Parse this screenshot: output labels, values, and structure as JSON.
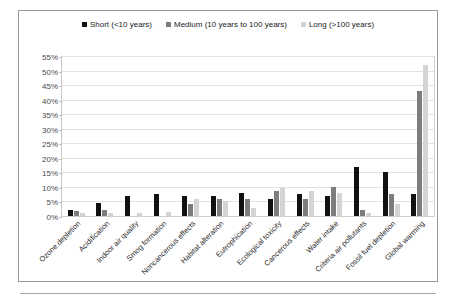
{
  "chart_data": {
    "type": "bar",
    "title": "",
    "xlabel": "",
    "ylabel": "",
    "ylim": [
      0,
      55
    ],
    "ytick_labels": [
      "55%",
      "50%",
      "45%",
      "40%",
      "35%",
      "30%",
      "25%",
      "20%",
      "15%",
      "10%",
      "5%",
      "0%"
    ],
    "ytick_values": [
      55,
      50,
      45,
      40,
      35,
      30,
      25,
      20,
      15,
      10,
      5,
      0
    ],
    "grid": true,
    "legend_position": "top-center",
    "categories": [
      "Ozone depletion",
      "Acidification",
      "Indoor air quality",
      "Smog formation",
      "Noncancerous effects",
      "Habitat alteration",
      "Eutrophication",
      "Ecological toxicity",
      "Cancerous effects",
      "Water intake",
      "Criteria air pollutants",
      "Fossil fuel depletion",
      "Global warming"
    ],
    "series": [
      {
        "name": "Short (<10 years)",
        "color": "#111111",
        "values": [
          2,
          4.5,
          7,
          7.5,
          7,
          7,
          8,
          6,
          7.5,
          7,
          17,
          15,
          7.5
        ]
      },
      {
        "name": "Medium (10 years to 100 years)",
        "color": "#7d7d7d",
        "values": [
          1.7,
          2,
          0,
          0,
          4,
          6,
          6,
          8.5,
          6,
          10,
          2,
          7.5,
          43
        ]
      },
      {
        "name": "Long (>100 years)",
        "color": "#d4d4d4",
        "values": [
          1.2,
          1.2,
          1.2,
          1.5,
          6,
          5,
          2.7,
          9.5,
          8.5,
          8,
          1.2,
          4,
          52
        ]
      }
    ]
  },
  "legend": {
    "items": [
      {
        "label": "Short (<10 years)",
        "color": "#111111"
      },
      {
        "label": "Medium (10 years to 100 years)",
        "color": "#7d7d7d"
      },
      {
        "label": "Long (>100 years)",
        "color": "#d4d4d4"
      }
    ]
  },
  "colors": {
    "short": "#111111",
    "medium": "#7d7d7d",
    "long": "#d4d4d4",
    "gridline": "#e2e2e2",
    "frame": "#9a9a9a",
    "axis_text": "#4a4a4a"
  }
}
